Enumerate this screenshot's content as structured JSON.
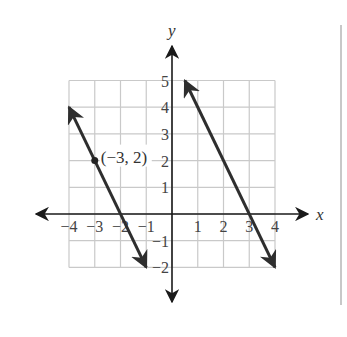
{
  "chart_data": {
    "type": "line",
    "title": "",
    "xlabel": "x",
    "ylabel": "y",
    "xlim": [
      -4,
      4
    ],
    "ylim": [
      -2,
      5
    ],
    "grid": true,
    "x_ticks": [
      -4,
      -3,
      -2,
      -1,
      1,
      2,
      3,
      4
    ],
    "y_ticks": [
      -2,
      -1,
      1,
      2,
      3,
      4,
      5
    ],
    "x_tick_labels": [
      "−4",
      "−3",
      "−2",
      "−1",
      "1",
      "2",
      "3",
      "4"
    ],
    "y_tick_labels": [
      "−2",
      "−1",
      "1",
      "2",
      "3",
      "4",
      "5"
    ],
    "series": [
      {
        "name": "line-1",
        "equation": "y = -2x - 4",
        "slope": -2,
        "x": [
          -4,
          -1
        ],
        "y": [
          4,
          -2
        ],
        "arrows": "both"
      },
      {
        "name": "line-2",
        "equation": "y = -2x + 6",
        "slope": -2,
        "x": [
          0.5,
          4
        ],
        "y": [
          5,
          -2
        ],
        "arrows": "both"
      }
    ],
    "annotations": [
      {
        "text": "(−3, 2)",
        "x": -3,
        "y": 2,
        "marker": "dot"
      }
    ]
  },
  "colors": {
    "grid": "#c9c9c9",
    "axis": "#1a1a1a",
    "line": "#2e2e2e",
    "separator": "#c8c8c8"
  },
  "axis_labels": {
    "x": "x",
    "y": "y"
  },
  "point_label": "(−3, 2)"
}
